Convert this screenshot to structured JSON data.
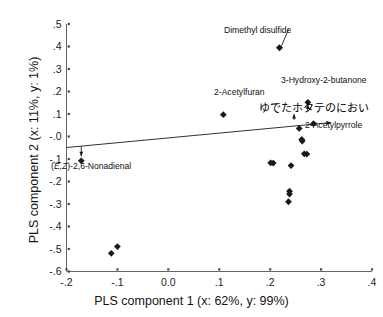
{
  "chart_data": {
    "type": "scatter",
    "title": "",
    "xlabel": "PLS component 1 (x: 62%, y: 99%)",
    "ylabel": "PLS component 2 (x: 11%, y: 1%)",
    "xlim": [
      -0.2,
      0.4
    ],
    "ylim": [
      -0.6,
      0.5
    ],
    "grid": false,
    "legend": "none",
    "xticks": [
      -0.2,
      -0.1,
      0.0,
      0.1,
      0.2,
      0.3,
      0.4
    ],
    "xtick_labels": [
      "-.2",
      "-.1",
      "0.0",
      ".1",
      ".2",
      ".3",
      ".4"
    ],
    "yticks": [
      -0.6,
      -0.5,
      -0.4,
      -0.3,
      -0.2,
      -0.1,
      -0.0,
      0.1,
      0.2,
      0.3,
      0.4,
      0.5
    ],
    "ytick_labels": [
      "-.6",
      "-.5",
      "-.4",
      "-.3",
      "-.2",
      "-.1",
      "-.0",
      ".1",
      ".2",
      ".3",
      ".4",
      ".5"
    ],
    "points": [
      {
        "x": -0.171,
        "y": -0.108
      },
      {
        "x": -0.112,
        "y": -0.519
      },
      {
        "x": -0.1,
        "y": -0.489
      },
      {
        "x": 0.108,
        "y": 0.097
      },
      {
        "x": 0.201,
        "y": -0.117
      },
      {
        "x": 0.206,
        "y": -0.118
      },
      {
        "x": 0.218,
        "y": 0.395
      },
      {
        "x": 0.236,
        "y": -0.29
      },
      {
        "x": 0.238,
        "y": -0.243
      },
      {
        "x": 0.238,
        "y": -0.256
      },
      {
        "x": 0.241,
        "y": -0.129
      },
      {
        "x": 0.257,
        "y": 0.036
      },
      {
        "x": 0.262,
        "y": -0.013
      },
      {
        "x": 0.263,
        "y": -0.02
      },
      {
        "x": 0.267,
        "y": -0.077
      },
      {
        "x": 0.272,
        "y": -0.078
      },
      {
        "x": 0.274,
        "y": 0.152
      },
      {
        "x": 0.285,
        "y": 0.057
      }
    ],
    "annotations": [
      {
        "name": "dimethyl-disulfide",
        "text": "Dimethyl disulfide",
        "point": {
          "x": 0.218,
          "y": 0.395
        }
      },
      {
        "name": "2-acetylfuran",
        "text": "2-Acetylfuran",
        "point": {
          "x": 0.248,
          "y": 0.105
        }
      },
      {
        "name": "3-hydroxy-2-butanone",
        "text": "3-Hydroxy-2-butanone",
        "point": {
          "x": 0.274,
          "y": 0.152
        }
      },
      {
        "name": "2-acetylpyrrole",
        "text": "2-Acetylpyrrole",
        "point": {
          "x": 0.257,
          "y": 0.036
        }
      },
      {
        "name": "ez-2-6-nonadienal",
        "text": "(E,Z)-2,6-Nonadienal",
        "text_prefix": "(",
        "text_italic": "E,Z",
        "text_suffix": ")-2,6-Nonadienal",
        "point": {
          "x": -0.171,
          "y": -0.108
        }
      },
      {
        "name": "boiled-scallop-odor-jp",
        "text": "ゆでたホタテのにおい",
        "point": {
          "x": 0.32,
          "y": 0.062
        }
      }
    ],
    "y_loading_vector": {
      "from": {
        "x": -0.2,
        "y": -0.049
      },
      "to": {
        "x": 0.32,
        "y": 0.062
      }
    },
    "marker": {
      "shape": "diamond",
      "color": "#1a1a1a",
      "size": 3.4
    }
  }
}
